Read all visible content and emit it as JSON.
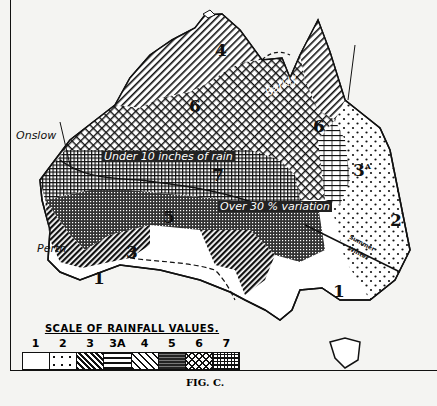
{
  "figure": {
    "caption": "FIG. C."
  },
  "map_labels": {
    "regions": [
      {
        "id": "r1_sw",
        "value": "1"
      },
      {
        "id": "r1_se",
        "value": "1"
      },
      {
        "id": "r2",
        "value": "2"
      },
      {
        "id": "r3",
        "value": "3"
      },
      {
        "id": "r3a",
        "value": "3"
      },
      {
        "id": "r4",
        "value": "4"
      },
      {
        "id": "r5_w",
        "value": "5"
      },
      {
        "id": "r5_e",
        "value": "5"
      },
      {
        "id": "r6_w",
        "value": "6"
      },
      {
        "id": "r6_e",
        "value": "6"
      },
      {
        "id": "r7",
        "value": "7"
      }
    ],
    "places": {
      "onslow": "Onslow",
      "perth": "Perth",
      "barkly": "Barkly"
    },
    "annotations": {
      "under_10": "Under 10 inches of rain",
      "over_30": "Over 30 % variation",
      "summer": "Summer",
      "winter": "Winter"
    }
  },
  "legend": {
    "title": "SCALE OF RAINFALL VALUES.",
    "items": [
      {
        "label": "1",
        "pattern": "blank"
      },
      {
        "label": "2",
        "pattern": "sparse-dots"
      },
      {
        "label": "3",
        "pattern": "dense-diagonal-dark"
      },
      {
        "label": "3A",
        "pattern": "brick"
      },
      {
        "label": "4",
        "pattern": "diagonal-lines"
      },
      {
        "label": "5",
        "pattern": "dense-crosshatch-dark"
      },
      {
        "label": "6",
        "pattern": "diamond-crosshatch"
      },
      {
        "label": "7",
        "pattern": "square-grid"
      }
    ]
  },
  "colors": {
    "ink": "#111111",
    "paper": "#f4f4f2"
  }
}
